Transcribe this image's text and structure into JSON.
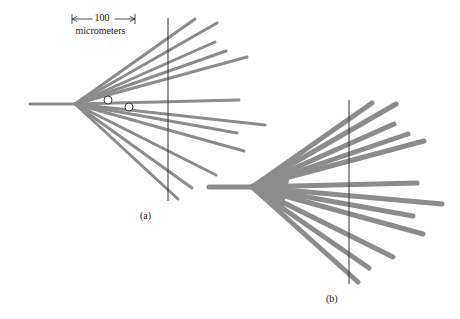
{
  "colors": {
    "branch": "#8c8c8c",
    "reference_line": "#333333",
    "circle": "#333333",
    "text": "#222222"
  },
  "scale_bar": {
    "value": "100",
    "unit": "micrometers",
    "x1": 72,
    "x2": 135,
    "y": 19
  },
  "panel_a": {
    "label": "(a)",
    "label_pos": [
      147,
      217
    ],
    "origin": [
      75,
      104
    ],
    "stem_start": [
      30,
      104
    ],
    "stroke_width": 3,
    "vertical_line": {
      "x": 168,
      "y1": 18,
      "y2": 201
    },
    "branches": [
      [
        195,
        19
      ],
      [
        217,
        23
      ],
      [
        215,
        42
      ],
      [
        226,
        51
      ],
      [
        247,
        57
      ],
      [
        239,
        100
      ],
      [
        265,
        125
      ],
      [
        237,
        133
      ],
      [
        244,
        151
      ],
      [
        216,
        175
      ],
      [
        192,
        188
      ],
      [
        178,
        199
      ]
    ],
    "circles": [
      {
        "cx": 108,
        "cy": 100,
        "r": 4
      },
      {
        "cx": 129,
        "cy": 107,
        "r": 4
      }
    ]
  },
  "panel_b": {
    "label": "(b)",
    "label_pos": [
      333,
      300
    ],
    "origin": [
      252,
      187
    ],
    "stem_start": [
      209,
      187
    ],
    "stroke_width": 5,
    "wedge": [
      [
        252,
        187
      ],
      [
        293,
        160
      ],
      [
        283,
        210
      ]
    ],
    "vertical_line": {
      "x": 349,
      "y1": 100,
      "y2": 284
    },
    "branches": [
      [
        372,
        103
      ],
      [
        396,
        104
      ],
      [
        394,
        124
      ],
      [
        408,
        134
      ],
      [
        424,
        141
      ],
      [
        417,
        183
      ],
      [
        442,
        204
      ],
      [
        413,
        216
      ],
      [
        423,
        234
      ],
      [
        393,
        257
      ],
      [
        369,
        268
      ],
      [
        358,
        282
      ]
    ]
  }
}
